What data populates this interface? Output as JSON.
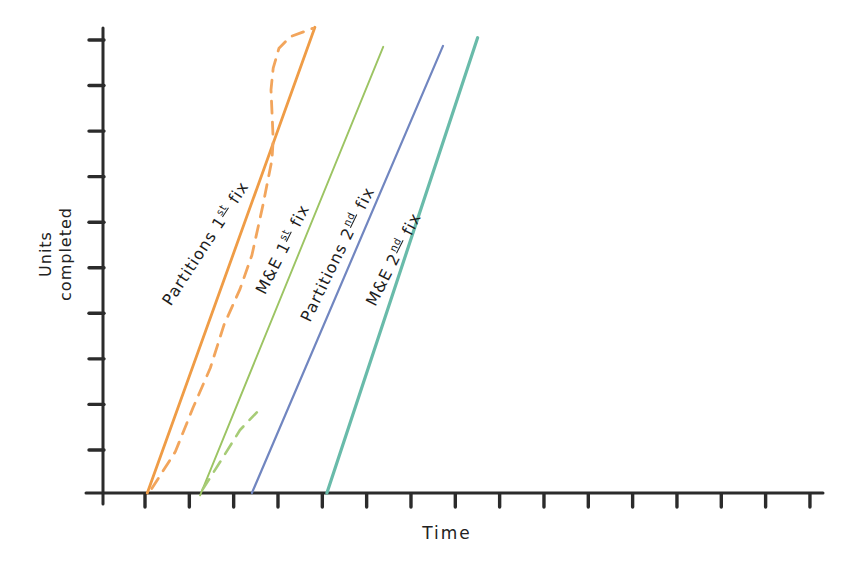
{
  "figure": {
    "background": "#ffffff",
    "axis_color": "#2b2b2b",
    "text_color": "#222222"
  },
  "labels": {
    "y_axis_line1": "Units",
    "y_axis_line2": "completed",
    "x_axis_title": "Time"
  },
  "chart_data": {
    "type": "line",
    "title": "",
    "xlabel": "Time",
    "ylabel": "Units completed",
    "grid": false,
    "legend_position": "labels rotated alongside each line",
    "x_axis": {
      "tick_count": 16,
      "numeric_labels": false
    },
    "y_axis": {
      "tick_count": 10,
      "numeric_labels": false
    },
    "units_note": "axes carry unlabeled tick marks; point values below are in tick units (x = time ticks from origin, y = units-completed ticks from origin)",
    "series": [
      {
        "id": "partitions-1st-planned",
        "name": "Partitions 1st fix",
        "label": {
          "prefix": "Partitions 1",
          "sup": "st",
          "suffix": " fix"
        },
        "line_style": "solid",
        "color": "#ef9c46",
        "stroke_width": 2.8,
        "points": [
          [
            1.0,
            0.0
          ],
          [
            4.78,
            10.28
          ]
        ]
      },
      {
        "id": "partitions-1st-actual",
        "name": "Partitions 1st fix (actual progress, dashed)",
        "line_style": "dashed",
        "color": "#f2a55c",
        "stroke_width": 2.8,
        "points": [
          [
            1.1,
            0.1
          ],
          [
            1.63,
            0.91
          ],
          [
            2.03,
            1.88
          ],
          [
            2.42,
            2.76
          ],
          [
            2.73,
            3.71
          ],
          [
            3.09,
            4.5
          ],
          [
            3.36,
            5.25
          ],
          [
            3.61,
            6.36
          ],
          [
            3.81,
            7.35
          ],
          [
            3.84,
            7.8
          ],
          [
            3.79,
            8.9
          ],
          [
            3.84,
            9.38
          ],
          [
            3.97,
            9.82
          ],
          [
            4.22,
            10.07
          ],
          [
            4.74,
            10.26
          ]
        ]
      },
      {
        "id": "me-1st-planned",
        "name": "M&E 1st fix",
        "label": {
          "prefix": "M&E 1",
          "sup": "st",
          "suffix": " fix"
        },
        "line_style": "solid",
        "color": "#9cc463",
        "stroke_width": 1.9,
        "points": [
          [
            2.19,
            -0.05
          ],
          [
            6.32,
            9.85
          ]
        ]
      },
      {
        "id": "me-1st-actual",
        "name": "M&E 1st fix (actual progress, dashed)",
        "line_style": "dashed",
        "color": "#a7cc77",
        "stroke_width": 2.6,
        "points": [
          [
            2.25,
            0.08
          ],
          [
            2.71,
            0.79
          ],
          [
            3.09,
            1.39
          ],
          [
            3.47,
            1.78
          ]
        ]
      },
      {
        "id": "partitions-2nd-planned",
        "name": "Partitions 2nd fix",
        "label": {
          "prefix": "Partitions 2",
          "sup": "nd",
          "suffix": " fix"
        },
        "line_style": "solid",
        "color": "#7186c0",
        "stroke_width": 2.2,
        "points": [
          [
            3.36,
            0.0
          ],
          [
            7.67,
            9.87
          ]
        ]
      },
      {
        "id": "me-2nd-planned",
        "name": "M&E 2nd fix",
        "label": {
          "prefix": "M&E 2",
          "sup": "nd",
          "suffix": " fix"
        },
        "line_style": "solid",
        "color": "#69bbaa",
        "stroke_width": 3.2,
        "points": [
          [
            5.05,
            0.0
          ],
          [
            8.45,
            10.05
          ]
        ]
      }
    ]
  }
}
